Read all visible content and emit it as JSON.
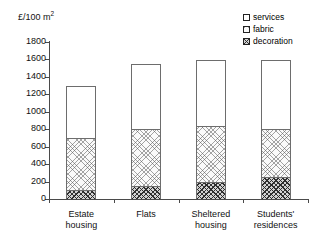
{
  "chart_data": {
    "type": "bar",
    "subtype": "stacked-bar",
    "title": "",
    "xlabel": "",
    "ylabel": "£/100 m",
    "ylabel_sup": "2",
    "ylim": [
      0,
      1800
    ],
    "ytick_step": 200,
    "yticks": [
      0,
      200,
      400,
      600,
      800,
      1000,
      1200,
      1400,
      1600,
      1800
    ],
    "ytick_labels": [
      "0",
      "200",
      "400",
      "600",
      "800",
      "1000",
      "1200",
      "1400",
      "1600",
      "1800"
    ],
    "grid": false,
    "legend_position": "top-right",
    "categories": [
      "Estate housing",
      "Flats",
      "Sheltered housing",
      "Students' residences"
    ],
    "category_lines": [
      [
        "Estate",
        "housing"
      ],
      [
        "Flats",
        ""
      ],
      [
        "Sheltered",
        "housing"
      ],
      [
        "Students'",
        "residences"
      ]
    ],
    "series": [
      {
        "name": "decoration",
        "values": [
          100,
          150,
          200,
          250
        ],
        "fill": "dark-crosshatch"
      },
      {
        "name": "fabric",
        "values": [
          600,
          650,
          640,
          550
        ],
        "fill": "light-crosshatch"
      },
      {
        "name": "services",
        "values": [
          600,
          750,
          750,
          790
        ],
        "fill": "white"
      }
    ],
    "cumulative_tops": {
      "decoration": [
        100,
        150,
        200,
        250
      ],
      "fabric": [
        700,
        800,
        840,
        800
      ],
      "services": [
        1300,
        1550,
        1590,
        1590
      ]
    },
    "totals": [
      1300,
      1550,
      1590,
      1590
    ]
  },
  "legend": {
    "items": [
      {
        "label": "services"
      },
      {
        "label": "fabric"
      },
      {
        "label": "decoration"
      }
    ]
  },
  "colors": {
    "axis": "#4a4a4a",
    "bar_outline": "#6d6d6d",
    "services_fill": "#ffffff",
    "fabric_fill": "#fafafa",
    "decoration_fill": "#d2d2d2",
    "text": "#111111",
    "background": "#ffffff"
  }
}
